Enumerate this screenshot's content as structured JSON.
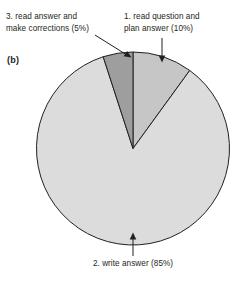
{
  "figure": {
    "panel_letter": "(b)",
    "callouts": {
      "slice3": "3. read answer and\nmake corrections (5%)",
      "slice1": "1. read question and\nplan answer (10%)",
      "slice2": "2. write answer (85%)"
    }
  },
  "chart_data": {
    "type": "pie",
    "title": "",
    "subtitle": "",
    "panel_label": "(b)",
    "categories": [
      "1. read question and plan answer",
      "2. write answer",
      "3. read answer and make corrections"
    ],
    "values": [
      10,
      85,
      5
    ],
    "value_unit": "percent",
    "labels": [
      "1. read question and plan answer (10%)",
      "2. write answer (85%)",
      "3. read answer and make corrections (5%)"
    ],
    "colors": [
      "#c6c6c6",
      "#dcdcdc",
      "#9e9e9e"
    ],
    "stroke_color": "#231f20",
    "start_angle_deg": 0,
    "direction": "clockwise",
    "legend": "none",
    "annotations": [
      {
        "text": "3. read answer and make corrections (5%)",
        "points_to": "5% wedge",
        "arrow": "diagonal"
      },
      {
        "text": "1. read question and plan answer (10%)",
        "points_to": "10% wedge",
        "arrow": "vertical-down"
      },
      {
        "text": "2. write answer (85%)",
        "points_to": "85% wedge",
        "arrow": "vertical-up"
      }
    ],
    "grid": false,
    "xlabel": "",
    "ylabel": ""
  }
}
